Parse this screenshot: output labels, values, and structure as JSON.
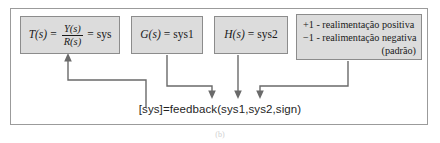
{
  "figure": {
    "caption": "(b)",
    "colors": {
      "box_fill": "#dcdcdc",
      "box_border": "#8c8c8c",
      "frame_border": "#9b9b9b",
      "connector": "#6a6a6a",
      "text": "#1a1a1a",
      "background": "#ffffff"
    }
  },
  "boxes": [
    {
      "id": "transfer-function",
      "lhs": "T(s)",
      "equals": "=",
      "numerator": "Y(s)",
      "denominator": "R(s)",
      "equals2": "=",
      "rhs": "sys"
    },
    {
      "id": "forward-gain",
      "text": "G(s) = sys1",
      "lhs": "G(s)",
      "equals": "=",
      "rhs": "sys1"
    },
    {
      "id": "feedback-gain",
      "text": "H(s) = sys2",
      "lhs": "H(s)",
      "equals": "=",
      "rhs": "sys2"
    },
    {
      "id": "sign-legend",
      "lines": [
        "+1 - realimentação positiva",
        "−1 - realimentação negativa",
        "(padrão)"
      ]
    }
  ],
  "command": {
    "text": "[sys]=feedback(sys1,sys2,sign)"
  },
  "connectors": [
    {
      "id": "output-to-transfer",
      "direction": "up",
      "target": "transfer-function-box"
    },
    {
      "id": "sys1-to-command",
      "direction": "down",
      "source": "forward-gain-box"
    },
    {
      "id": "sys2-to-command",
      "direction": "down",
      "source": "feedback-gain-box"
    },
    {
      "id": "sign-to-command",
      "direction": "down",
      "source": "sign-legend-box"
    }
  ]
}
